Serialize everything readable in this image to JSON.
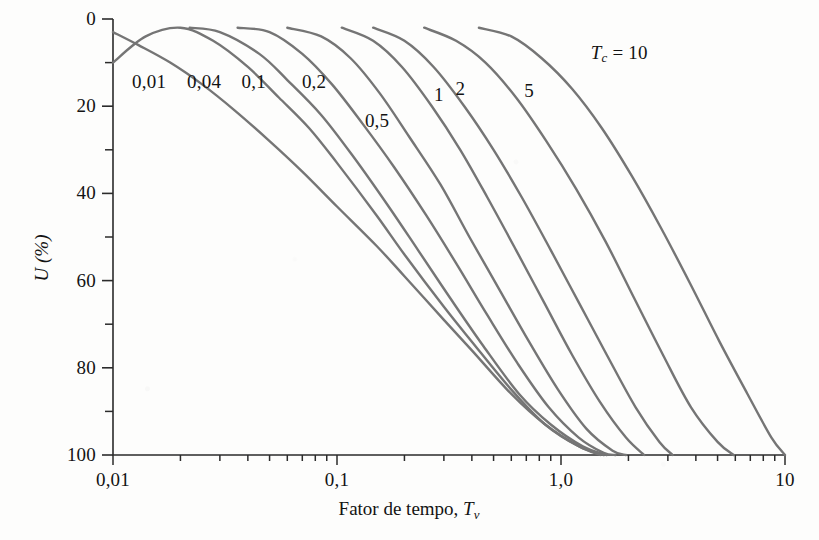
{
  "figure": {
    "background_color": "#fdfdfc",
    "curve_color": "#757575",
    "axis_color": "#2b2b2b",
    "text_color": "#131313"
  },
  "axes": {
    "x_title_prefix": "Fator de tempo, ",
    "x_title_symbol": "T",
    "x_title_subscript": "v",
    "y_title": "U (%)",
    "x_tick_labels": [
      "0,01",
      "0,1",
      "1,0",
      "10"
    ],
    "y_tick_labels": [
      "0",
      "20",
      "40",
      "60",
      "80",
      "100"
    ]
  },
  "curve_group_label": {
    "symbol": "T",
    "subscript": "c",
    "equals": " = ",
    "value": "10"
  },
  "curve_labels": [
    "0,01",
    "0,04",
    "0,1",
    "0,2",
    "0,5",
    "1",
    "2",
    "5"
  ],
  "chart_data": {
    "type": "line",
    "title": "",
    "xlabel": "Fator de tempo, Tv",
    "ylabel": "U (%)",
    "x_scale": "log",
    "xlim": [
      0.01,
      10
    ],
    "ylim": [
      0,
      100
    ],
    "y_inverted": true,
    "grid": false,
    "legend": "inline-curve-labels",
    "legend_title": "Tc",
    "x_ticks_major": [
      0.01,
      0.1,
      1.0,
      10
    ],
    "y_ticks_major": [
      0,
      20,
      40,
      60,
      80,
      100
    ],
    "y_ticks_minor": [
      10,
      30,
      50,
      70,
      90
    ],
    "series": [
      {
        "name": "0,01",
        "label": "0,01",
        "label_position": {
          "tv": 0.0145,
          "u": 14.5
        },
        "points": [
          {
            "tv": 0.01,
            "u": 3
          },
          {
            "tv": 0.013,
            "u": 6
          },
          {
            "tv": 0.018,
            "u": 10
          },
          {
            "tv": 0.025,
            "u": 15
          },
          {
            "tv": 0.035,
            "u": 21
          },
          {
            "tv": 0.05,
            "u": 28
          },
          {
            "tv": 0.07,
            "u": 35
          },
          {
            "tv": 0.1,
            "u": 43
          },
          {
            "tv": 0.15,
            "u": 52
          },
          {
            "tv": 0.2,
            "u": 59
          },
          {
            "tv": 0.3,
            "u": 69
          },
          {
            "tv": 0.4,
            "u": 76
          },
          {
            "tv": 0.6,
            "u": 86
          },
          {
            "tv": 0.85,
            "u": 93
          },
          {
            "tv": 1.2,
            "u": 98
          },
          {
            "tv": 1.5,
            "u": 100
          }
        ]
      },
      {
        "name": "0,04",
        "label": "0,04",
        "label_position": {
          "tv": 0.0255,
          "u": 14.5
        },
        "points": [
          {
            "tv": 0.01,
            "u": 10
          },
          {
            "tv": 0.014,
            "u": 4
          },
          {
            "tv": 0.02,
            "u": 2
          },
          {
            "tv": 0.028,
            "u": 5
          },
          {
            "tv": 0.04,
            "u": 11
          },
          {
            "tv": 0.055,
            "u": 18
          },
          {
            "tv": 0.075,
            "u": 25
          },
          {
            "tv": 0.1,
            "u": 33
          },
          {
            "tv": 0.15,
            "u": 45
          },
          {
            "tv": 0.2,
            "u": 54
          },
          {
            "tv": 0.3,
            "u": 66
          },
          {
            "tv": 0.4,
            "u": 74
          },
          {
            "tv": 0.6,
            "u": 85
          },
          {
            "tv": 0.85,
            "u": 93
          },
          {
            "tv": 1.2,
            "u": 98
          },
          {
            "tv": 1.55,
            "u": 100
          }
        ]
      },
      {
        "name": "0,1",
        "label": "0,1",
        "label_position": {
          "tv": 0.0425,
          "u": 14.5
        },
        "points": [
          {
            "tv": 0.022,
            "u": 2
          },
          {
            "tv": 0.03,
            "u": 3
          },
          {
            "tv": 0.045,
            "u": 8
          },
          {
            "tv": 0.06,
            "u": 14
          },
          {
            "tv": 0.085,
            "u": 22
          },
          {
            "tv": 0.12,
            "u": 32
          },
          {
            "tv": 0.17,
            "u": 43
          },
          {
            "tv": 0.23,
            "u": 53
          },
          {
            "tv": 0.32,
            "u": 64
          },
          {
            "tv": 0.45,
            "u": 75
          },
          {
            "tv": 0.65,
            "u": 86
          },
          {
            "tv": 0.9,
            "u": 93
          },
          {
            "tv": 1.25,
            "u": 98
          },
          {
            "tv": 1.6,
            "u": 100
          }
        ]
      },
      {
        "name": "0,2",
        "label": "0,2",
        "label_position": {
          "tv": 0.079,
          "u": 14.5
        },
        "points": [
          {
            "tv": 0.036,
            "u": 2
          },
          {
            "tv": 0.05,
            "u": 3
          },
          {
            "tv": 0.07,
            "u": 8
          },
          {
            "tv": 0.095,
            "u": 15
          },
          {
            "tv": 0.13,
            "u": 24
          },
          {
            "tv": 0.18,
            "u": 34
          },
          {
            "tv": 0.25,
            "u": 45
          },
          {
            "tv": 0.34,
            "u": 56
          },
          {
            "tv": 0.47,
            "u": 68
          },
          {
            "tv": 0.64,
            "u": 79
          },
          {
            "tv": 0.88,
            "u": 89
          },
          {
            "tv": 1.2,
            "u": 96
          },
          {
            "tv": 1.55,
            "u": 99.5
          },
          {
            "tv": 1.75,
            "u": 100
          }
        ]
      },
      {
        "name": "0,5",
        "label": "0,5",
        "label_position": {
          "tv": 0.151,
          "u": 23.5
        },
        "points": [
          {
            "tv": 0.06,
            "u": 2
          },
          {
            "tv": 0.085,
            "u": 4
          },
          {
            "tv": 0.115,
            "u": 9
          },
          {
            "tv": 0.155,
            "u": 17
          },
          {
            "tv": 0.21,
            "u": 27
          },
          {
            "tv": 0.29,
            "u": 38
          },
          {
            "tv": 0.39,
            "u": 50
          },
          {
            "tv": 0.53,
            "u": 62
          },
          {
            "tv": 0.72,
            "u": 74
          },
          {
            "tv": 0.97,
            "u": 85
          },
          {
            "tv": 1.3,
            "u": 94
          },
          {
            "tv": 1.7,
            "u": 99
          },
          {
            "tv": 1.95,
            "u": 100
          }
        ]
      },
      {
        "name": "1",
        "label": "1",
        "label_position": {
          "tv": 0.285,
          "u": 17.5
        },
        "points": [
          {
            "tv": 0.105,
            "u": 2
          },
          {
            "tv": 0.145,
            "u": 5
          },
          {
            "tv": 0.195,
            "u": 11
          },
          {
            "tv": 0.265,
            "u": 20
          },
          {
            "tv": 0.355,
            "u": 30
          },
          {
            "tv": 0.47,
            "u": 41
          },
          {
            "tv": 0.63,
            "u": 53
          },
          {
            "tv": 0.84,
            "u": 65
          },
          {
            "tv": 1.12,
            "u": 77
          },
          {
            "tv": 1.5,
            "u": 88
          },
          {
            "tv": 1.95,
            "u": 96
          },
          {
            "tv": 2.35,
            "u": 100
          }
        ]
      },
      {
        "name": "2",
        "label": "2",
        "label_position": {
          "tv": 0.355,
          "u": 16
        },
        "points": [
          {
            "tv": 0.145,
            "u": 2
          },
          {
            "tv": 0.2,
            "u": 5
          },
          {
            "tv": 0.27,
            "u": 11
          },
          {
            "tv": 0.37,
            "u": 20
          },
          {
            "tv": 0.5,
            "u": 30
          },
          {
            "tv": 0.67,
            "u": 41
          },
          {
            "tv": 0.9,
            "u": 53
          },
          {
            "tv": 1.2,
            "u": 65
          },
          {
            "tv": 1.6,
            "u": 77
          },
          {
            "tv": 2.15,
            "u": 89
          },
          {
            "tv": 2.75,
            "u": 97
          },
          {
            "tv": 3.15,
            "u": 100
          }
        ]
      },
      {
        "name": "5",
        "label": "5",
        "label_position": {
          "tv": 0.72,
          "u": 16.5
        },
        "points": [
          {
            "tv": 0.245,
            "u": 2
          },
          {
            "tv": 0.34,
            "u": 5
          },
          {
            "tv": 0.46,
            "u": 10
          },
          {
            "tv": 0.63,
            "u": 18
          },
          {
            "tv": 0.86,
            "u": 28
          },
          {
            "tv": 1.17,
            "u": 39
          },
          {
            "tv": 1.58,
            "u": 51
          },
          {
            "tv": 2.12,
            "u": 64
          },
          {
            "tv": 2.85,
            "u": 77
          },
          {
            "tv": 3.8,
            "u": 89
          },
          {
            "tv": 5.0,
            "u": 97
          },
          {
            "tv": 5.9,
            "u": 100
          }
        ]
      },
      {
        "name": "10",
        "label": "Tc = 10",
        "label_position": {
          "tv": 1.82,
          "u": 8
        },
        "points": [
          {
            "tv": 0.43,
            "u": 2
          },
          {
            "tv": 0.6,
            "u": 4
          },
          {
            "tv": 0.82,
            "u": 9
          },
          {
            "tv": 1.12,
            "u": 16
          },
          {
            "tv": 1.52,
            "u": 25
          },
          {
            "tv": 2.07,
            "u": 36
          },
          {
            "tv": 2.8,
            "u": 48
          },
          {
            "tv": 3.8,
            "u": 61
          },
          {
            "tv": 5.1,
            "u": 74
          },
          {
            "tv": 6.8,
            "u": 86
          },
          {
            "tv": 8.7,
            "u": 96
          },
          {
            "tv": 10.0,
            "u": 100
          }
        ]
      }
    ]
  }
}
